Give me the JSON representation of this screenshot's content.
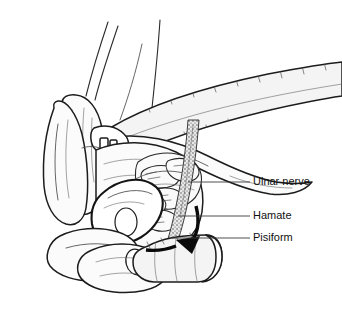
{
  "figure": {
    "style": "black-and-white line drawing",
    "background_color": "#ffffff",
    "line_color": "#1c1c1c",
    "labels": [
      {
        "id": "ulnar-nerve",
        "text": "Ulnar nerve",
        "x": 253,
        "y": 182,
        "leader": {
          "x1": 188,
          "y1": 182,
          "x2": 250,
          "y2": 182
        }
      },
      {
        "id": "hamate",
        "text": "Hamate",
        "x": 253,
        "y": 216,
        "leader": {
          "x1": 178,
          "y1": 216,
          "x2": 250,
          "y2": 216
        }
      },
      {
        "id": "pisiform",
        "text": "Pisiform",
        "x": 253,
        "y": 238,
        "leader": {
          "x1": 172,
          "y1": 238,
          "x2": 250,
          "y2": 238
        }
      }
    ],
    "arrow": {
      "id": "pressure-arrow",
      "description": "bold curved arrow indicating direction of applied pressure",
      "color": "#0a0a0a"
    },
    "structures": [
      {
        "id": "examiner-hand",
        "name": "examiner hand with thumb and fingers"
      },
      {
        "id": "forearm-band",
        "name": "upper forearm band"
      },
      {
        "id": "wrist-cylinder",
        "name": "lower wrist cylinder"
      },
      {
        "id": "carpal-bones",
        "name": "carpal bone cluster"
      },
      {
        "id": "ulnar-nerve-band",
        "name": "stippled ulnar nerve band"
      }
    ]
  }
}
